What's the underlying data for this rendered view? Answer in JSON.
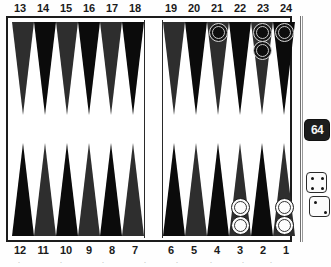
{
  "board": {
    "title": "Backgammon Board Position",
    "top_left_labels": [
      "13",
      "14",
      "15",
      "16",
      "17",
      "18"
    ],
    "top_right_labels": [
      "19",
      "20",
      "21",
      "22",
      "23",
      "24"
    ],
    "bottom_left_labels": [
      "12",
      "11",
      "10",
      "9",
      "8",
      "7"
    ],
    "bottom_right_labels": [
      "6",
      "5",
      "4",
      "3",
      "2",
      "1"
    ],
    "colors": {
      "point_dark": "#2e2e2e",
      "point_black": "#0b0b0b",
      "board_background": "#ffffff",
      "frame": "#1c1c1c",
      "checker_black": "#141414",
      "checker_white": "#fbfbfb",
      "cube_background": "#1d1d1d",
      "cube_text": "#f4f4f4"
    },
    "point_styles": {
      "top_left": [
        "dark",
        "black",
        "dark",
        "black",
        "dark",
        "black"
      ],
      "top_right": [
        "dark",
        "black",
        "dark",
        "black",
        "dark",
        "black"
      ],
      "bottom_left": [
        "black",
        "dark",
        "black",
        "dark",
        "black",
        "dark"
      ],
      "bottom_right": [
        "black",
        "dark",
        "black",
        "dark",
        "black",
        "dark"
      ]
    }
  },
  "checkers": {
    "point_21": {
      "point": "21",
      "color": "black",
      "count": 1
    },
    "point_23": {
      "point": "23",
      "color": "black",
      "count": 2
    },
    "point_24": {
      "point": "24",
      "color": "black",
      "count": 1
    },
    "point_3": {
      "point": "3",
      "color": "white",
      "count": 2
    },
    "point_1": {
      "point": "1",
      "color": "white",
      "count": 2
    }
  },
  "side_panel": {
    "doubling_cube": {
      "value": "64",
      "label": "doubling cube"
    },
    "dice": [
      {
        "name": "die-one",
        "value": 4
      },
      {
        "name": "die-two",
        "value": 2
      }
    ]
  },
  "footer_ghost": [
    "·",
    "·",
    "·",
    "·",
    "·",
    "·",
    "·",
    "·"
  ]
}
